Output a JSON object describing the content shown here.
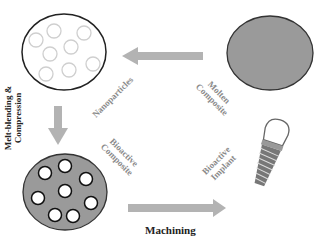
{
  "diagram": {
    "nodes": {
      "nanoparticles_matrix": {
        "label": "Nanoparticles"
      },
      "molten_composite": {
        "label_line1": "Molten",
        "label_line2": "Composite"
      },
      "bioactive_composite": {
        "label_line1": "Bioactive",
        "label_line2": "Composite"
      },
      "bioactive_implant": {
        "label_line1": "Bioactive",
        "label_line2": "Implant"
      }
    },
    "edges": {
      "molten_to_nanoparticles": {
        "direction": "left"
      },
      "melt_blending": {
        "label_line1": "Melt-blending &",
        "label_line2": "Compression",
        "direction": "down"
      },
      "machining": {
        "label": "Machining",
        "direction": "right"
      }
    },
    "colors": {
      "arrow": "#b3b3b3",
      "fill_gray": "#9a9a9a",
      "outline": "#222222",
      "empty_circle": "#c8c8c8",
      "label_gray": "#8a8a8a"
    }
  }
}
